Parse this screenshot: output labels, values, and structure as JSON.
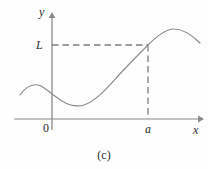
{
  "figure": {
    "caption": "(c)",
    "axes": {
      "y_axis_label": "y",
      "x_axis_label": "x",
      "origin_label": "0"
    },
    "annotations": {
      "limit_label": "L",
      "point_label": "a"
    },
    "colors": {
      "background": "#fefefe",
      "curve": "#8a8a8a",
      "axis": "#8a8a8a",
      "dashed": "#7d7d7d",
      "text": "#2b2b2b"
    }
  },
  "chart_data": {
    "type": "line",
    "title": "(c)",
    "xlabel": "x",
    "ylabel": "y",
    "grid": false,
    "legend": null,
    "xlim": [
      14,
      204
    ],
    "ylim": [
      14,
      130
    ],
    "axes_pixels": {
      "x_axis_y": 119,
      "x_axis_x_start": 14,
      "x_axis_x_end": 200,
      "y_axis_x": 52,
      "y_axis_y_top": 14,
      "y_axis_y_bottom": 130
    },
    "annotations": [
      {
        "label": "L",
        "type": "horizontal-dashed-line",
        "from": [
          52,
          45
        ],
        "to": [
          148,
          45
        ]
      },
      {
        "label": "a",
        "type": "vertical-dashed-line",
        "from": [
          148,
          45
        ],
        "to": [
          148,
          119
        ]
      }
    ],
    "curve_path": "M 20,95 C 27,85 34,83 41,86 C 48,90 54,96 62,101 C 70,106 77,107 84,105 C 96,101 106,89 118,76 C 130,63 140,53 148,45 C 158,35 166,29 174,29 C 183,29 191,34 200,43",
    "points": [
      {
        "x": 20,
        "y": 95,
        "note": "curve start (left edge)"
      },
      {
        "x": 41,
        "y": 86,
        "note": "local maximum left of y-axis"
      },
      {
        "x": 52,
        "y": 91,
        "note": "crosses y-axis descending"
      },
      {
        "x": 79,
        "y": 107,
        "note": "local minimum"
      },
      {
        "x": 148,
        "y": 45,
        "note": "point (a, L) where curve meets dashed lines"
      },
      {
        "x": 175,
        "y": 29,
        "note": "global maximum on the right"
      },
      {
        "x": 200,
        "y": 43,
        "note": "curve end (right edge)"
      }
    ]
  }
}
